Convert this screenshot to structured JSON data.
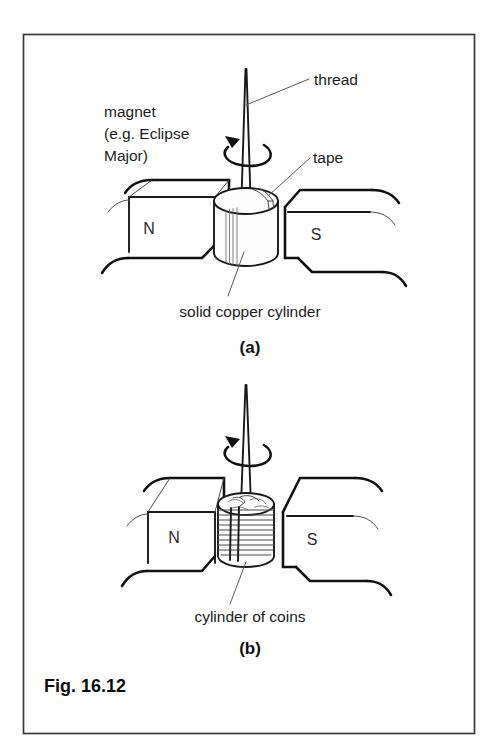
{
  "figure": {
    "caption": "Fig. 16.12",
    "frame": {
      "border_color": "#3a3a3a"
    },
    "ink_color": "#111111",
    "background": "#ffffff"
  },
  "panels": [
    {
      "id": "a",
      "part_label": "(a)",
      "labels": {
        "magnet_line1": "magnet",
        "magnet_line2": "(e.g. Eclipse",
        "magnet_line3": "Major)",
        "thread": "thread",
        "tape": "tape",
        "specimen": "solid copper cylinder",
        "pole_north": "N",
        "pole_south": "S"
      },
      "specimen_type": "solid copper cylinder"
    },
    {
      "id": "b",
      "part_label": "(b)",
      "labels": {
        "specimen": "cylinder of coins",
        "pole_north": "N",
        "pole_south": "S"
      },
      "specimen_type": "cylinder of coins",
      "coin_count": 10
    }
  ]
}
